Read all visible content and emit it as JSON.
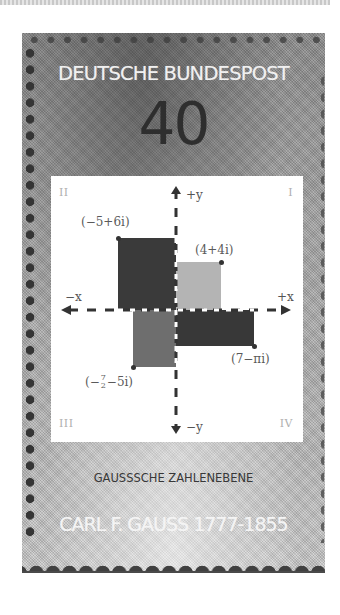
{
  "stamp": {
    "country": "DEUTSCHE BUNDESPOST",
    "denomination": "40",
    "caption": "GAUSSSCHE ZAHLENEBENE",
    "footer": "CARL F. GAUSS 1777-1855"
  },
  "plane": {
    "quadrants": {
      "I": "I",
      "II": "II",
      "III": "III",
      "IV": "IV"
    },
    "axes": {
      "pos_y": "+y",
      "neg_y": "−y",
      "pos_x": "+x",
      "neg_x": "−x"
    },
    "points": [
      {
        "label": "(−5+6i)",
        "re": -5,
        "im": 6,
        "color": "#3a3a3a"
      },
      {
        "label": "(4+4i)",
        "re": 4,
        "im": 4,
        "color": "#b4b4b4"
      },
      {
        "label": "(7−πi)",
        "re": 7,
        "im": -3.14,
        "color": "#383838"
      },
      {
        "label_prefix": "(−",
        "label_num": "7",
        "label_den": "2",
        "label_suffix": "−5i)",
        "re": -3.5,
        "im": -5,
        "color": "#6e6e6e"
      }
    ]
  },
  "colors": {
    "stamp_gray": "#a9a9a9",
    "panel_white": "#ffffff",
    "dark_square": "#3a3a3a",
    "light_square": "#b4b4b4",
    "mid_square": "#6e6e6e"
  }
}
